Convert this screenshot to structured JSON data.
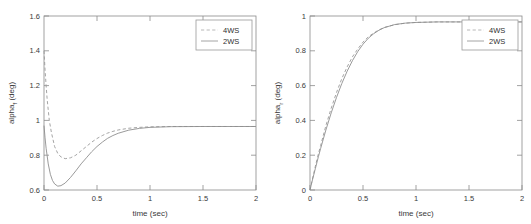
{
  "figure": {
    "background_color": "#ffffff",
    "axis_color": "#8a8a8a",
    "panel_count": 2
  },
  "chart_data": [
    {
      "id": "front-slip-angle",
      "type": "line",
      "title": "",
      "xlabel": "time (sec)",
      "ylabel": "alpha_f (deg)",
      "ylabel_base": "alpha",
      "ylabel_subscript": "f",
      "ylabel_units": "(deg)",
      "xlim": [
        0,
        2
      ],
      "ylim": [
        0.6,
        1.6
      ],
      "xticks": [
        0,
        0.5,
        1,
        1.5,
        2
      ],
      "xticklabels": [
        "0",
        "0.5",
        "1",
        "1.5",
        "2"
      ],
      "yticks": [
        0.6,
        0.8,
        1,
        1.2,
        1.4,
        1.6
      ],
      "yticklabels": [
        "0.6",
        "0.8",
        "1",
        "1.2",
        "1.4",
        "1.6"
      ],
      "grid": false,
      "legend_position": "upper right",
      "legend_entries": [
        "4WS",
        "2WS"
      ],
      "series": [
        {
          "name": "4WS",
          "style": "dashed",
          "color": "#9a9a9a",
          "x": [
            0,
            0.01,
            0.02,
            0.03,
            0.05,
            0.07,
            0.1,
            0.13,
            0.16,
            0.2,
            0.25,
            0.3,
            0.35,
            0.4,
            0.45,
            0.5,
            0.55,
            0.6,
            0.65,
            0.7,
            0.8,
            0.9,
            1.0,
            1.2,
            1.5,
            1.75,
            2.0
          ],
          "y": [
            1.4,
            1.29,
            1.2,
            1.12,
            1.0,
            0.93,
            0.85,
            0.81,
            0.79,
            0.78,
            0.785,
            0.8,
            0.825,
            0.85,
            0.875,
            0.896,
            0.913,
            0.927,
            0.937,
            0.945,
            0.955,
            0.96,
            0.963,
            0.965,
            0.965,
            0.965,
            0.965
          ]
        },
        {
          "name": "2WS",
          "style": "solid",
          "color": "#8f8f8f",
          "x": [
            0,
            0.01,
            0.02,
            0.04,
            0.06,
            0.08,
            0.1,
            0.13,
            0.16,
            0.2,
            0.25,
            0.3,
            0.35,
            0.4,
            0.45,
            0.5,
            0.55,
            0.6,
            0.65,
            0.7,
            0.8,
            0.9,
            1.0,
            1.2,
            1.5,
            1.75,
            2.0
          ],
          "y": [
            0.97,
            0.9,
            0.84,
            0.75,
            0.69,
            0.655,
            0.635,
            0.622,
            0.625,
            0.64,
            0.672,
            0.71,
            0.75,
            0.785,
            0.82,
            0.85,
            0.875,
            0.897,
            0.913,
            0.926,
            0.944,
            0.954,
            0.96,
            0.964,
            0.965,
            0.965,
            0.965
          ]
        }
      ]
    },
    {
      "id": "rear-slip-angle",
      "type": "line",
      "title": "",
      "xlabel": "time (sec)",
      "ylabel": "alpha_r (deg)",
      "ylabel_base": "alpha",
      "ylabel_subscript": "r",
      "ylabel_units": "(deg)",
      "xlim": [
        0,
        2
      ],
      "ylim": [
        0,
        1
      ],
      "xticks": [
        0,
        0.5,
        1,
        1.5,
        2
      ],
      "xticklabels": [
        "0",
        "0.5",
        "1",
        "1.5",
        "2"
      ],
      "yticks": [
        0,
        0.2,
        0.4,
        0.6,
        0.8,
        1
      ],
      "yticklabels": [
        "0",
        "0.2",
        "0.4",
        "0.6",
        "0.8",
        "1"
      ],
      "grid": false,
      "legend_position": "upper right",
      "legend_entries": [
        "4WS",
        "2WS"
      ],
      "series": [
        {
          "name": "4WS",
          "style": "dashed",
          "color": "#9a9a9a",
          "x": [
            0,
            0.02,
            0.05,
            0.08,
            0.1,
            0.15,
            0.2,
            0.25,
            0.3,
            0.35,
            0.4,
            0.45,
            0.5,
            0.55,
            0.6,
            0.65,
            0.7,
            0.8,
            0.9,
            1.0,
            1.2,
            1.5,
            1.75,
            2.0
          ],
          "y": [
            0,
            0.055,
            0.135,
            0.21,
            0.255,
            0.37,
            0.47,
            0.56,
            0.64,
            0.707,
            0.765,
            0.81,
            0.85,
            0.88,
            0.902,
            0.92,
            0.934,
            0.95,
            0.959,
            0.963,
            0.966,
            0.966,
            0.966,
            0.966
          ]
        },
        {
          "name": "2WS",
          "style": "solid",
          "color": "#8f8f8f",
          "x": [
            0,
            0.02,
            0.05,
            0.08,
            0.1,
            0.15,
            0.2,
            0.25,
            0.3,
            0.35,
            0.4,
            0.45,
            0.5,
            0.55,
            0.6,
            0.65,
            0.7,
            0.8,
            0.9,
            1.0,
            1.2,
            1.5,
            1.75,
            2.0
          ],
          "y": [
            0,
            0.05,
            0.122,
            0.193,
            0.238,
            0.345,
            0.443,
            0.532,
            0.612,
            0.682,
            0.743,
            0.795,
            0.838,
            0.872,
            0.898,
            0.918,
            0.933,
            0.951,
            0.959,
            0.963,
            0.966,
            0.966,
            0.966,
            0.966
          ]
        }
      ]
    }
  ]
}
